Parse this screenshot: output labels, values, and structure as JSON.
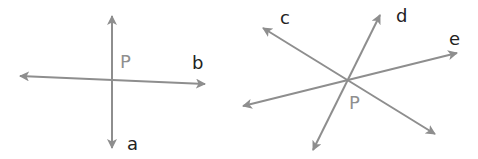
{
  "colors": {
    "line": "#8e8e8e",
    "line_label": "#222222",
    "point_label": "#8f8f8f",
    "background": "#ffffff"
  },
  "figures": [
    {
      "id": "left",
      "description": "Two lines a and b intersecting at point P",
      "intersection": {
        "label": "P",
        "x": 112,
        "y": 80
      },
      "lines": [
        {
          "label": "a",
          "from": [
            112,
            16
          ],
          "to": [
            112,
            148
          ],
          "arrows": "both"
        },
        {
          "label": "b",
          "from": [
            20,
            76
          ],
          "to": [
            205,
            84
          ],
          "arrows": "both"
        }
      ],
      "labels": {
        "P": "P",
        "a": "a",
        "b": "b"
      }
    },
    {
      "id": "right",
      "description": "Three lines c, d and e intersecting at point P",
      "intersection": {
        "label": "P",
        "x": 347,
        "y": 80
      },
      "lines": [
        {
          "label": "c",
          "from": [
            263,
            28
          ],
          "to": [
            435,
            134
          ],
          "arrows": "both"
        },
        {
          "label": "d",
          "from": [
            380,
            15
          ],
          "to": [
            313,
            150
          ],
          "arrows": "both"
        },
        {
          "label": "e",
          "from": [
            457,
            53
          ],
          "to": [
            243,
            106
          ],
          "arrows": "both"
        }
      ],
      "labels": {
        "P": "P",
        "c": "c",
        "d": "d",
        "e": "e"
      }
    }
  ]
}
